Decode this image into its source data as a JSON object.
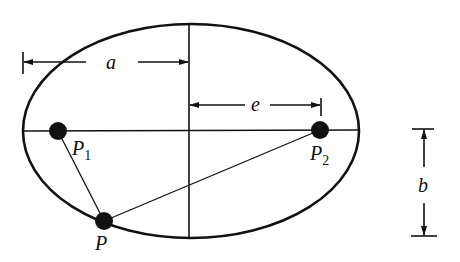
{
  "diagram": {
    "type": "ellipse-with-foci",
    "labels": {
      "a": "a",
      "e": "e",
      "b": "b",
      "p1": "P",
      "p1_sub": "1",
      "p2": "P",
      "p2_sub": "2",
      "p": "P"
    },
    "ellipse": {
      "cx": 191,
      "cy": 131,
      "rx": 168,
      "ry": 107
    },
    "points": {
      "P1": {
        "x": 58,
        "y": 131
      },
      "P2": {
        "x": 320,
        "y": 130
      },
      "P": {
        "x": 104,
        "y": 221
      }
    },
    "colors": {
      "stroke": "#111111",
      "background": "#ffffff"
    }
  }
}
